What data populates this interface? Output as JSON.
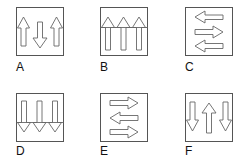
{
  "figure": {
    "stroke_color": "#555555",
    "panels": [
      {
        "label": "A",
        "pattern": "up, down, up",
        "arrows": [
          "up",
          "down",
          "up"
        ]
      },
      {
        "label": "B",
        "pattern": "up, up, up",
        "arrows": [
          "up",
          "up",
          "up"
        ]
      },
      {
        "label": "C",
        "pattern": "left, right, left",
        "arrows": [
          "left",
          "right",
          "left"
        ]
      },
      {
        "label": "D",
        "pattern": "down, down, down",
        "arrows": [
          "down",
          "down",
          "down"
        ]
      },
      {
        "label": "E",
        "pattern": "right, left, right",
        "arrows": [
          "right",
          "left",
          "right"
        ]
      },
      {
        "label": "F",
        "pattern": "down, up, down",
        "arrows": [
          "down",
          "up",
          "down"
        ]
      }
    ]
  }
}
